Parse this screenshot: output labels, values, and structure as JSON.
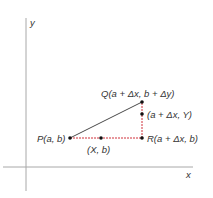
{
  "diagram": {
    "axes": {
      "x_label": "x",
      "y_label": "y",
      "axis_color": "#9a9a9a"
    },
    "points": {
      "P": {
        "label": "P(a, b)"
      },
      "Q": {
        "label": "Q(a + Δx, b + Δy)"
      },
      "R": {
        "label": "R(a + Δx, b)"
      },
      "X_point": {
        "label": "(X, b)"
      },
      "Y_point": {
        "label": "(a + Δx, Y)"
      }
    },
    "colors": {
      "hypotenuse": "#333333",
      "legs": "#d0303a",
      "points": "#111111"
    }
  }
}
